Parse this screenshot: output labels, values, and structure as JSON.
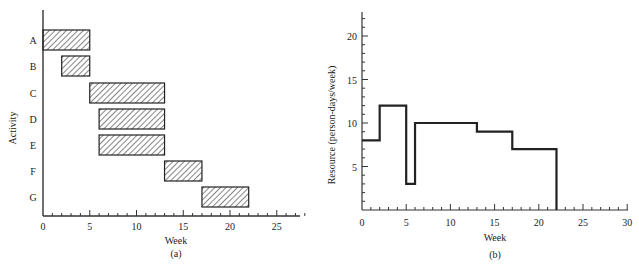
{
  "chart_data": [
    {
      "type": "gantt",
      "panel_label": "(a)",
      "xlabel": "Week",
      "ylabel": "Activity",
      "xlim": [
        0,
        27
      ],
      "x_ticks": [
        0,
        5,
        10,
        15,
        20,
        25
      ],
      "categories": [
        "A",
        "B",
        "C",
        "D",
        "E",
        "F",
        "G"
      ],
      "bars": [
        {
          "activity": "A",
          "start": 0,
          "end": 5
        },
        {
          "activity": "B",
          "start": 2,
          "end": 5
        },
        {
          "activity": "C",
          "start": 5,
          "end": 13
        },
        {
          "activity": "D",
          "start": 6,
          "end": 13
        },
        {
          "activity": "E",
          "start": 6,
          "end": 13
        },
        {
          "activity": "F",
          "start": 13,
          "end": 17
        },
        {
          "activity": "G",
          "start": 17,
          "end": 22
        }
      ],
      "fill": "hatched",
      "grid": false
    },
    {
      "type": "line",
      "style": "step",
      "panel_label": "(b)",
      "xlabel": "Week",
      "ylabel": "Resource (person-days/week)",
      "xlim": [
        0,
        30
      ],
      "ylim": [
        0,
        23
      ],
      "x_ticks": [
        0,
        5,
        10,
        15,
        20,
        25,
        30
      ],
      "y_ticks": [
        5,
        10,
        15,
        20
      ],
      "steps": [
        {
          "start": 0,
          "end": 2,
          "value": 8
        },
        {
          "start": 2,
          "end": 5,
          "value": 12
        },
        {
          "start": 5,
          "end": 6,
          "value": 3
        },
        {
          "start": 6,
          "end": 13,
          "value": 10
        },
        {
          "start": 13,
          "end": 17,
          "value": 9
        },
        {
          "start": 17,
          "end": 22,
          "value": 7
        }
      ],
      "grid": false
    }
  ],
  "labels": {
    "a_caption": "(a)",
    "b_caption": "(b)",
    "a_xlabel": "Week",
    "b_xlabel": "Week",
    "a_ylabel": "Activity",
    "b_ylabel": "Resource (person-days/week)"
  }
}
